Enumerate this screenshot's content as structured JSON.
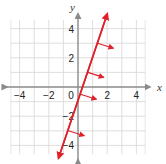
{
  "chart_data": {
    "type": "line",
    "title": "",
    "xlabel": "x",
    "ylabel": "y",
    "xlim": [
      -5,
      5
    ],
    "ylim": [
      -5,
      5
    ],
    "grid": true,
    "x_ticks": [
      -4,
      -2,
      0,
      2,
      4
    ],
    "y_ticks": [
      -4,
      -2,
      2,
      4
    ],
    "x_tick_labels": [
      "−4",
      "−2",
      "0",
      "2",
      "4"
    ],
    "y_tick_labels": [
      "−4",
      "−2",
      "2",
      "4"
    ],
    "series": [
      {
        "name": "boundary line",
        "equation": "y = 3x - 1",
        "slope": 3,
        "intercept": -1,
        "x": [
          -1.33,
          2
        ],
        "y": [
          -5,
          5
        ],
        "style": "solid",
        "color": "#e0202a",
        "arrowheads": "both"
      }
    ],
    "annotations": [
      {
        "type": "shading-direction-arrows",
        "direction": "right",
        "at_y": [
          3,
          1,
          -0.5,
          -3
        ],
        "color": "#e0202a"
      }
    ],
    "colors": {
      "line": "#e0202a",
      "axis": "#8a8a8a",
      "grid": "#d6d6d6"
    }
  }
}
